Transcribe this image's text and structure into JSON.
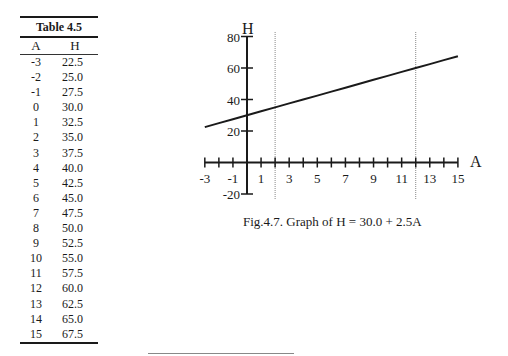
{
  "table": {
    "title": "Table 4.5",
    "headers": [
      "A",
      "H"
    ],
    "rows": [
      [
        "-3",
        "22.5"
      ],
      [
        "-2",
        "25.0"
      ],
      [
        "-1",
        "27.5"
      ],
      [
        "0",
        "30.0"
      ],
      [
        "1",
        "32.5"
      ],
      [
        "2",
        "35.0"
      ],
      [
        "3",
        "37.5"
      ],
      [
        "4",
        "40.0"
      ],
      [
        "5",
        "42.5"
      ],
      [
        "6",
        "45.0"
      ],
      [
        "7",
        "47.5"
      ],
      [
        "8",
        "50.0"
      ],
      [
        "9",
        "52.5"
      ],
      [
        "10",
        "55.0"
      ],
      [
        "11",
        "57.5"
      ],
      [
        "12",
        "60.0"
      ],
      [
        "13",
        "62.5"
      ],
      [
        "14",
        "65.0"
      ],
      [
        "15",
        "67.5"
      ]
    ]
  },
  "figure": {
    "caption": "Fig.4.7.   Graph of H = 30.0 + 2.5A"
  },
  "chart_data": {
    "type": "line",
    "title": "Graph of H = 30.0 + 2.5A",
    "xlabel": "A",
    "ylabel": "H",
    "x": [
      -3,
      -2,
      -1,
      0,
      1,
      2,
      3,
      4,
      5,
      6,
      7,
      8,
      9,
      10,
      11,
      12,
      13,
      14,
      15
    ],
    "series": [
      {
        "name": "H = 30.0 + 2.5A",
        "values": [
          22.5,
          25.0,
          27.5,
          30.0,
          32.5,
          35.0,
          37.5,
          40.0,
          42.5,
          45.0,
          47.5,
          50.0,
          52.5,
          55.0,
          57.5,
          60.0,
          62.5,
          65.0,
          67.5
        ]
      }
    ],
    "xlim": [
      -3,
      15
    ],
    "ylim": [
      -20,
      80
    ],
    "x_tick_labels": [
      "-3",
      "-1",
      "1",
      "3",
      "5",
      "7",
      "9",
      "11",
      "13",
      "15"
    ],
    "y_tick_labels": [
      "80",
      "60",
      "40",
      "20",
      "-20"
    ],
    "x_ticks_every": 1,
    "reference_lines": [
      {
        "orientation": "vertical",
        "x": 2,
        "style": "dotted"
      },
      {
        "orientation": "vertical",
        "x": 12,
        "style": "dotted"
      }
    ],
    "grid": false,
    "legend": null
  }
}
